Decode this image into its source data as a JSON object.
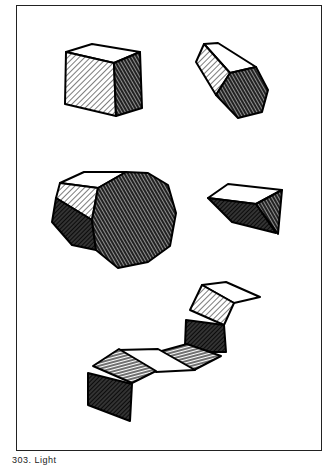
{
  "figure": {
    "caption": "303. Light",
    "colors": {
      "ink": "#111111",
      "paper": "#ffffff",
      "frame": "#222222"
    },
    "shapes": [
      {
        "id": "cube",
        "label": "cube"
      },
      {
        "id": "hexagonal-prism",
        "label": "hexagonal prism"
      },
      {
        "id": "octagonal-prism",
        "label": "octagonal prism"
      },
      {
        "id": "triangular-prism",
        "label": "triangular prism"
      },
      {
        "id": "folded-strip",
        "label": "folded strip"
      }
    ]
  }
}
